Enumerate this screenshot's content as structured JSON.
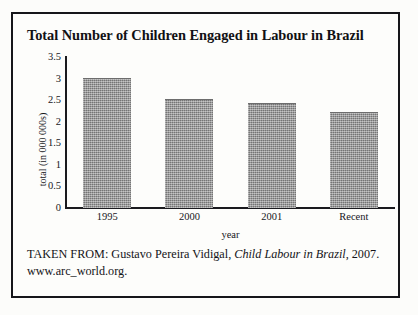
{
  "figure": {
    "title": "Total Number of Children Engaged in Labour in Brazil",
    "source_prefix": "TAKEN FROM: Gustavo Pereira Vidigal, ",
    "source_title_italic": "Child Labour in Brazil",
    "source_suffix": ", 2007.",
    "source_url": "www.arc_world.org.",
    "frame_color": "#16161a",
    "bar_color": "#8d8d8d",
    "text_color": "#17171b"
  },
  "chart_data": {
    "type": "bar",
    "title": "Total Number of Children Engaged in Labour in Brazil",
    "categories": [
      "1995",
      "2000",
      "2001",
      "Recent"
    ],
    "values": [
      3,
      2.5,
      2.4,
      2.2
    ],
    "xlabel": "year",
    "ylabel": "total (in 000 000s)",
    "ylim": [
      0,
      3.5
    ],
    "ytick_labels": [
      "0",
      "0.5",
      "1",
      "1.5",
      "2",
      "2.5",
      "3",
      "3.5"
    ],
    "ytick_values": [
      0,
      0.5,
      1,
      1.5,
      2,
      2.5,
      3,
      3.5
    ],
    "grid": false,
    "legend": false
  }
}
